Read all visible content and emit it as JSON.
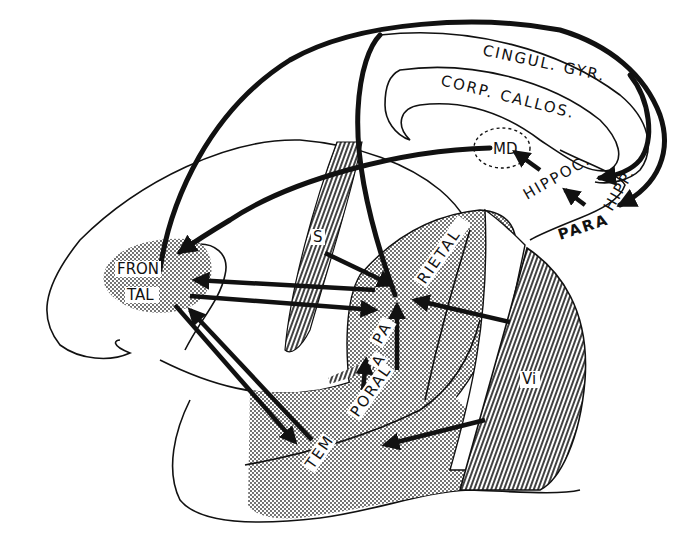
{
  "diagram": {
    "title": "",
    "colors": {
      "ink": "#111111",
      "background": "#ffffff"
    },
    "labels": {
      "cingulate": "CINGUL. GYR.",
      "callosum": "CORP. CALLOS.",
      "md": "MD",
      "hippocampus": "HIPPOC.",
      "parahipp_a": "PARA",
      "parahipp_b": "HIPP.",
      "frontal_a": "FRON",
      "frontal_b": "TAL",
      "somatic": "S",
      "parietal_a": "RIETAL",
      "parietal_b": "PA",
      "temporal_a": "TEM",
      "temporal_b": "PORAL",
      "auditory": "A",
      "visual": "Vi"
    },
    "regions": [
      {
        "id": "frontal",
        "label_parts": [
          "FRON",
          "TAL"
        ],
        "fill": "stipple"
      },
      {
        "id": "somatic",
        "label_parts": [
          "S"
        ],
        "fill": "hatch"
      },
      {
        "id": "parietal",
        "label_parts": [
          "PA",
          "RIETAL"
        ],
        "fill": "stipple"
      },
      {
        "id": "temporal",
        "label_parts": [
          "TEM",
          "PORAL"
        ],
        "fill": "stipple"
      },
      {
        "id": "auditory",
        "label_parts": [
          "A"
        ],
        "fill": "hatch"
      },
      {
        "id": "visual",
        "label_parts": [
          "Vi"
        ],
        "fill": "hatch"
      },
      {
        "id": "md",
        "label_parts": [
          "MD"
        ],
        "fill": "dashed-outline"
      },
      {
        "id": "hippocampus",
        "label_parts": [
          "HIPPOC."
        ],
        "fill": "none"
      },
      {
        "id": "parahippocampal",
        "label_parts": [
          "PARA",
          "HIPP."
        ],
        "fill": "none"
      },
      {
        "id": "cingulate",
        "label_parts": [
          "CINGUL. GYR."
        ],
        "fill": "none"
      },
      {
        "id": "corpus-callosum",
        "label_parts": [
          "CORP. CALLOS."
        ],
        "fill": "none"
      }
    ],
    "connections": [
      {
        "from": "somatic",
        "to": "parietal"
      },
      {
        "from": "auditory",
        "to": "parietal"
      },
      {
        "from": "visual",
        "to": "parietal"
      },
      {
        "from": "visual",
        "to": "temporal"
      },
      {
        "from": "parietal",
        "to": "frontal"
      },
      {
        "from": "frontal",
        "to": "parietal"
      },
      {
        "from": "temporal",
        "to": "frontal"
      },
      {
        "from": "frontal",
        "to": "temporal"
      },
      {
        "from": "md",
        "to": "frontal"
      },
      {
        "from": "hippocampus",
        "to": "md"
      },
      {
        "from": "parahippocampal",
        "to": "hippocampus"
      },
      {
        "from": "cingulate",
        "to": "parahippocampal"
      },
      {
        "from": "frontal",
        "to": "cingulate"
      },
      {
        "from": "parietal",
        "to": "cingulate"
      }
    ]
  }
}
